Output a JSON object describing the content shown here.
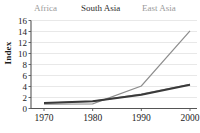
{
  "chart_data": {
    "type": "line",
    "title": "",
    "subtitle": "",
    "xlabel": "",
    "ylabel": "Index",
    "x": [
      1970,
      1980,
      1990,
      2000
    ],
    "xtick_labels": [
      "1970",
      "1980",
      "1990",
      "2000"
    ],
    "ytick_labels": [
      "0",
      "2",
      "4",
      "6",
      "8",
      "10",
      "12",
      "14",
      "16"
    ],
    "ytick_values": [
      0,
      2,
      4,
      6,
      8,
      10,
      12,
      14,
      16
    ],
    "ylim": [
      0,
      16
    ],
    "xlim": [
      1968,
      2003
    ],
    "grid": "horizontal",
    "legend_position": "top",
    "series": [
      {
        "name": "Africa",
        "values": [
          1.0,
          1.3,
          2.6,
          4.4
        ],
        "color": "#8d8d8d",
        "stroke_width": 1.2
      },
      {
        "name": "South Asia",
        "values": [
          1.0,
          1.3,
          2.5,
          4.3
        ],
        "color": "#3a3a3a",
        "stroke_width": 2.0
      },
      {
        "name": "East Asia",
        "values": [
          0.8,
          0.85,
          4.1,
          14.1
        ],
        "color": "#8d8d8d",
        "stroke_width": 1.2
      }
    ]
  },
  "legend": {
    "africa": "Africa",
    "south_asia": "South Asia",
    "east_asia": "East Asia"
  },
  "axes": {
    "y_label": "Index",
    "y_ticks": [
      "16",
      "14",
      "12",
      "10",
      "8",
      "6",
      "4",
      "2",
      "0"
    ],
    "x_ticks": [
      "1970",
      "1980",
      "1990",
      "2000"
    ]
  },
  "colors": {
    "light_series": "#8d8d8d",
    "dark_series": "#3a3a3a",
    "gridline": "#d8d8d8",
    "axis": "#555555",
    "text": "#1c1c1c",
    "legend_muted": "#9a9a9a",
    "background": "#ffffff"
  }
}
